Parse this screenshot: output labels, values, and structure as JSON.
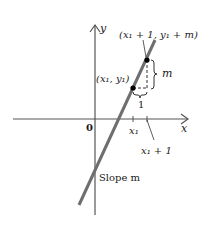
{
  "diagram": {
    "title": "",
    "axes": {
      "x_label": "x",
      "y_label": "y",
      "origin_label": "0"
    },
    "points": [
      {
        "id": "p1",
        "label": "(x₁, y₁)"
      },
      {
        "id": "p2",
        "label": "(x₁ + 1, y₁ + m)"
      }
    ],
    "ticks": [
      {
        "id": "x1",
        "label": "x₁"
      },
      {
        "id": "x1plus1",
        "label": "x₁ + 1"
      }
    ],
    "run_label": "1",
    "rise_label": "m",
    "line_label": "Slope m",
    "colors": {
      "line": "#6e6e6e",
      "axes": "#555555",
      "text": "#1a1a1a",
      "point": "#000000"
    }
  }
}
